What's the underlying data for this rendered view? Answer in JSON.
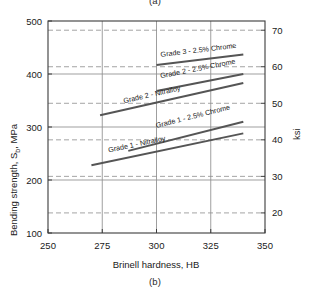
{
  "figure": {
    "caption_top": "(a)",
    "caption_bottom": "(b)"
  },
  "chart_data": {
    "type": "line",
    "title": "",
    "xlabel": "Brinell hardness, HB",
    "ylabel": "Bending strength, S",
    "ylabel_sub": "b",
    "ylabel_unit": ", MPa",
    "y2label": "ksi",
    "xlim": [
      250,
      350
    ],
    "ylim": [
      100,
      500
    ],
    "y2lim": [
      14.5,
      72.5
    ],
    "xticks": [
      250,
      275,
      300,
      325,
      350
    ],
    "xtick_labels": [
      "250",
      "275",
      "300",
      "325",
      "350"
    ],
    "yticks": [
      100,
      200,
      300,
      400,
      500
    ],
    "ytick_labels": [
      "100",
      "200",
      "300",
      "400",
      "500"
    ],
    "y2ticks": [
      20,
      30,
      40,
      50,
      60,
      70
    ],
    "y2tick_labels": [
      "20",
      "30",
      "40",
      "50",
      "60",
      "70"
    ],
    "grid": "solid gridlines at MPa 200/300/400 and HB 275/300/325; dashed gridlines at ksi 20/30/40/50/60/70",
    "grid_major_y": [
      200,
      300,
      400
    ],
    "grid_major_x": [
      275,
      300,
      325
    ],
    "grid_dashed_ksi": [
      20,
      30,
      40,
      50,
      60,
      70
    ],
    "legend_position": "inline labels on curves",
    "series": [
      {
        "name": "Grade 3 - 2.5% Chrome",
        "label": "Grade 3 - 2.5% Chrome",
        "x": [
          300,
          340
        ],
        "values": [
          417,
          437
        ],
        "label_x": 302,
        "label_y": 432
      },
      {
        "name": "Grade 2 - 2.5% Chrome",
        "label": "Grade 2 - 2.5% Chrome",
        "x": [
          300,
          340
        ],
        "values": [
          368,
          400
        ],
        "label_x": 302,
        "label_y": 392
      },
      {
        "name": "Grade 2 - Nitralloy",
        "label": "Grade 2 - Nitralloy",
        "x": [
          274,
          340
        ],
        "values": [
          322,
          383
        ],
        "label_x": 285,
        "label_y": 345
      },
      {
        "name": "Grade 1 - 2.5% Chrome",
        "label": "Grade 1 - 2.5% Chrome",
        "x": [
          287,
          340
        ],
        "values": [
          255,
          310
        ],
        "label_x": 300,
        "label_y": 298
      },
      {
        "name": "Grade 1 - Nitralloy",
        "label": "Grade 1 - Nitralloy",
        "x": [
          270,
          340
        ],
        "values": [
          228,
          288
        ],
        "label_x": 278,
        "label_y": 252
      }
    ]
  },
  "colors": {
    "curve": "#555555",
    "frame": "#3b3b3b",
    "grid_solid": "#8e8e8e",
    "grid_dashed": "#9a9a9a",
    "text": "#1a1a1a"
  }
}
